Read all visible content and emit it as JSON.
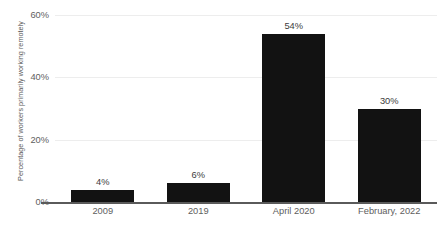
{
  "chart_data": {
    "type": "bar",
    "title": "",
    "xlabel": "",
    "ylabel": "Percentage of workers primarily working remotely",
    "categories": [
      "2009",
      "2019",
      "April 2020",
      "February, 2022"
    ],
    "values": [
      4,
      6,
      54,
      30
    ],
    "value_labels": [
      "4%",
      "6%",
      "54%",
      "30%"
    ],
    "ylim": [
      0,
      60
    ],
    "yticks": [
      0,
      20,
      40,
      60
    ],
    "ytick_labels": [
      "0%",
      "20%",
      "40%",
      "60%"
    ],
    "grid": true,
    "legend": null,
    "colors": {
      "bar": "#121212",
      "gridline": "#ededed",
      "axis_line": "#5a5a5a",
      "tick_text": "#5e5e5e",
      "value_text": "#3c3c3c",
      "background": "#ffffff"
    }
  }
}
